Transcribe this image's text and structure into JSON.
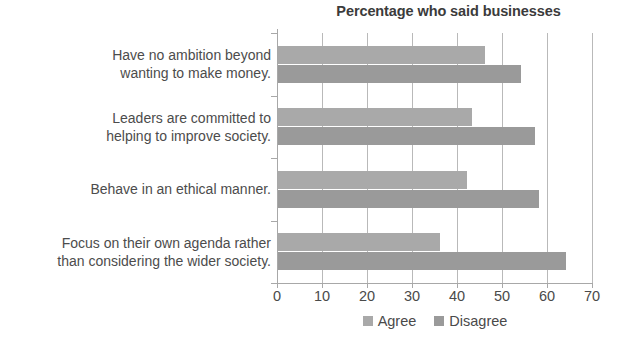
{
  "chart_data": {
    "type": "bar",
    "orientation": "horizontal",
    "title": "Percentage who said businesses",
    "xlabel": "",
    "ylabel": "",
    "xlim": [
      0,
      70
    ],
    "xticks": [
      0,
      10,
      20,
      30,
      40,
      50,
      60,
      70
    ],
    "xtick_labels": [
      "0",
      "10",
      "20",
      "30",
      "40",
      "50",
      "60",
      "70"
    ],
    "grid": true,
    "grid_axis": "x",
    "legend_position": "bottom-center",
    "categories": [
      "Have no ambition beyond\nwanting to make money.",
      "Leaders are committed to\nhelping to improve society.",
      "Behave in an ethical manner.",
      "Focus on their own agenda rather\nthan considering the wider society."
    ],
    "series": [
      {
        "name": "Agree",
        "color": "#a9a9a9",
        "values": [
          46,
          43,
          42,
          36
        ]
      },
      {
        "name": "Disagree",
        "color": "#9a9a9a",
        "values": [
          54,
          57,
          58,
          64
        ]
      }
    ]
  }
}
